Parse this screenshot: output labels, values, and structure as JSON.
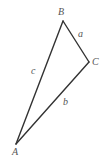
{
  "diagram": {
    "type": "triangle",
    "vertices": [
      {
        "name": "A",
        "x": 16,
        "y": 144,
        "label_x": 12,
        "label_y": 155
      },
      {
        "name": "B",
        "x": 63,
        "y": 21,
        "label_x": 58,
        "label_y": 15
      },
      {
        "name": "C",
        "x": 89,
        "y": 62,
        "label_x": 92,
        "label_y": 65
      }
    ],
    "sides": [
      {
        "name": "a",
        "from": "B",
        "to": "C",
        "label_x": 78,
        "label_y": 37
      },
      {
        "name": "b",
        "from": "C",
        "to": "A",
        "label_x": 63,
        "label_y": 105
      },
      {
        "name": "c",
        "from": "A",
        "to": "B",
        "label_x": 31,
        "label_y": 74
      }
    ],
    "line_color": "#333333",
    "label_color": "#555555"
  }
}
